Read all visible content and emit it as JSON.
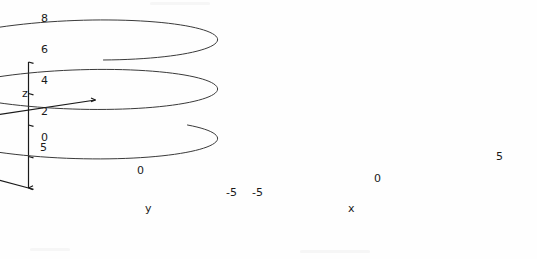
{
  "figure": {
    "title": "",
    "background_color": "#fefefe",
    "line_color": "#3a3a3a",
    "axis_color": "#1a1a1a",
    "width": 537,
    "height": 259
  },
  "axes": {
    "x": {
      "label": "x",
      "ticks": [
        "-5",
        "0",
        "5"
      ],
      "range": [
        -5,
        5
      ],
      "label_pos": {
        "x": 348,
        "y": 205
      },
      "tick_positions": [
        {
          "text": "-5",
          "x": 252,
          "y": 190
        },
        {
          "text": "0",
          "x": 374,
          "y": 176
        },
        {
          "text": "5",
          "x": 498,
          "y": 154
        }
      ]
    },
    "y": {
      "label": "y",
      "ticks": [
        "5",
        "0",
        "-5"
      ],
      "range": [
        -5,
        5
      ],
      "label_pos": {
        "x": 145,
        "y": 205
      },
      "tick_positions": [
        {
          "text": "5",
          "x": 40,
          "y": 146
        },
        {
          "text": "0",
          "x": 139,
          "y": 168
        },
        {
          "text": "-5",
          "x": 228,
          "y": 190
        }
      ]
    },
    "z": {
      "label": "z",
      "ticks": [
        "0",
        "2",
        "4",
        "6",
        "8"
      ],
      "range": [
        0,
        8
      ],
      "label_pos": {
        "x": 22,
        "y": 88
      },
      "tick_positions": [
        {
          "text": "8",
          "x": 41,
          "y": 18
        },
        {
          "text": "6",
          "x": 41,
          "y": 49
        },
        {
          "text": "4",
          "x": 41,
          "y": 80
        },
        {
          "text": "2",
          "x": 41,
          "y": 111
        },
        {
          "text": "0",
          "x": 41,
          "y": 137
        }
      ]
    }
  },
  "chart_data": {
    "type": "line",
    "plot_kind": "3d-parametric-helix",
    "title": "",
    "xlabel": "x",
    "ylabel": "y",
    "zlabel": "z",
    "xlim": [
      -5,
      5
    ],
    "ylim": [
      -5,
      5
    ],
    "zlim": [
      0,
      8
    ],
    "grid": false,
    "legend": null,
    "series": [
      {
        "name": "helix",
        "parametric": {
          "t_start": 0.0,
          "t_end": 14.5,
          "x_expr": "5*cos(t)",
          "y_expr": "5*sin(t)",
          "z_expr": "0.5*t",
          "samples": 260
        },
        "turns": 2.3,
        "radius": 5,
        "z_per_turn": 3.14,
        "color": "#3a3a3a",
        "linewidth": 1
      }
    ],
    "projection": {
      "type": "oblique-3d",
      "origin_px": {
        "x": 62,
        "y": 144
      },
      "z_top_px": {
        "x": 62,
        "y": 18
      },
      "x_axis_end_px": {
        "x": 497,
        "y": 156
      },
      "y_axis_end_px": {
        "x": 246,
        "y": 194
      },
      "x_unit_px": {
        "dx": 25.1,
        "dy": -3.8
      },
      "y_unit_px": {
        "dx": 18.4,
        "dy": 5.0
      },
      "z_unit_px": {
        "dx": 0,
        "dy": -15.75
      },
      "elev_deg": 12,
      "azim_deg": -45
    }
  },
  "annotations": {
    "arrow_markers_on_ticks": true,
    "tick_marker_shape": "arrow"
  }
}
